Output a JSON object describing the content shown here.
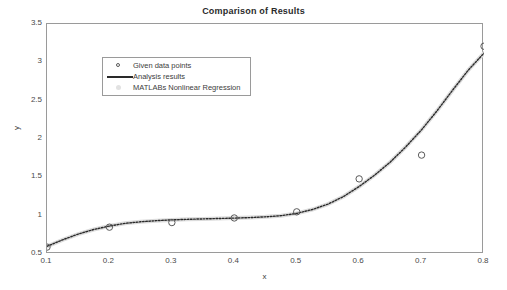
{
  "chart_data": {
    "type": "scatter",
    "title": "Comparison of Results",
    "xlabel": "x",
    "ylabel": "y",
    "xlim": [
      0.1,
      0.8
    ],
    "ylim": [
      0.5,
      3.5
    ],
    "xticks": [
      "0.1",
      "0.2",
      "0.3",
      "0.4",
      "0.5",
      "0.6",
      "0.7",
      "0.8"
    ],
    "yticks": [
      "0.5",
      "1",
      "1.5",
      "2",
      "2.5",
      "3",
      "3.5"
    ],
    "grid": false,
    "legend_position": "upper-left",
    "legend": [
      {
        "label": "Given data points",
        "marker": "circle-outline",
        "color": "#5a5a5a"
      },
      {
        "label": "Analysis results",
        "marker": "thick-line",
        "color": "#2a2a2a"
      },
      {
        "label": "MATLABs Nonlinear Regression",
        "marker": "faint-dot",
        "color": "#e2e2e2"
      }
    ],
    "series": [
      {
        "name": "Given data points",
        "type": "scatter",
        "marker": "circle-outline",
        "color": "#5a5a5a",
        "x": [
          0.1,
          0.2,
          0.3,
          0.4,
          0.5,
          0.6,
          0.7,
          0.8
        ],
        "y": [
          0.59,
          0.85,
          0.91,
          0.97,
          1.05,
          1.48,
          1.79,
          3.21
        ]
      },
      {
        "name": "Analysis results",
        "type": "line",
        "linestyle": "dotted",
        "color": "#2a2a2a",
        "x": [
          0.1,
          0.125,
          0.15,
          0.175,
          0.2,
          0.225,
          0.25,
          0.275,
          0.3,
          0.325,
          0.35,
          0.375,
          0.4,
          0.425,
          0.45,
          0.475,
          0.5,
          0.525,
          0.55,
          0.575,
          0.6,
          0.625,
          0.65,
          0.675,
          0.7,
          0.725,
          0.75,
          0.775,
          0.8
        ],
        "y": [
          0.6,
          0.685,
          0.76,
          0.82,
          0.865,
          0.9,
          0.92,
          0.935,
          0.945,
          0.952,
          0.958,
          0.963,
          0.968,
          0.975,
          0.985,
          1.0,
          1.03,
          1.08,
          1.15,
          1.25,
          1.38,
          1.53,
          1.7,
          1.9,
          2.12,
          2.37,
          2.64,
          2.9,
          3.12
        ]
      },
      {
        "name": "MATLABs Nonlinear Regression",
        "type": "line",
        "linestyle": "solid-faint",
        "color": "#dcdcdc",
        "x": [
          0.1,
          0.125,
          0.15,
          0.175,
          0.2,
          0.225,
          0.25,
          0.275,
          0.3,
          0.325,
          0.35,
          0.375,
          0.4,
          0.425,
          0.45,
          0.475,
          0.5,
          0.525,
          0.55,
          0.575,
          0.6,
          0.625,
          0.65,
          0.675,
          0.7,
          0.725,
          0.75,
          0.775,
          0.8
        ],
        "y": [
          0.6,
          0.685,
          0.76,
          0.82,
          0.865,
          0.9,
          0.92,
          0.935,
          0.945,
          0.952,
          0.958,
          0.963,
          0.968,
          0.975,
          0.985,
          1.0,
          1.03,
          1.08,
          1.15,
          1.25,
          1.38,
          1.53,
          1.7,
          1.9,
          2.12,
          2.37,
          2.64,
          2.9,
          3.12
        ]
      }
    ]
  },
  "axes": {
    "border_color": "#9a9a9a"
  }
}
